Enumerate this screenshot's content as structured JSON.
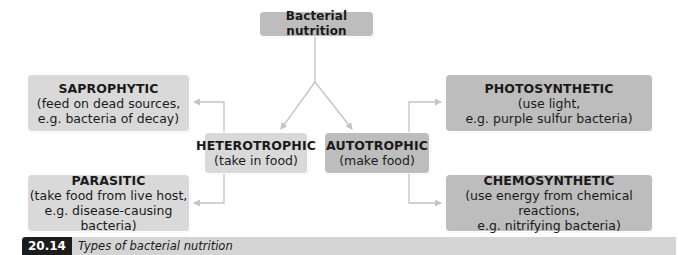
{
  "diagram": {
    "root": {
      "title": "Bacterial nutrition"
    },
    "branches": {
      "heterotrophic": {
        "title": "HETEROTROPHIC",
        "desc": "(take in food)",
        "children": {
          "saprophytic": {
            "title": "SAPROPHYTIC",
            "desc_line1": "(feed on dead sources,",
            "desc_line2": "e.g. bacteria of decay)"
          },
          "parasitic": {
            "title": "PARASITIC",
            "desc_line1": "(take food from live host,",
            "desc_line2": "e.g. disease-causing bacteria)"
          }
        }
      },
      "autotrophic": {
        "title": "AUTOTROPHIC",
        "desc": "(make food)",
        "children": {
          "photosynthetic": {
            "title": "PHOTOSYNTHETIC",
            "desc_line1": "(use light,",
            "desc_line2": "e.g. purple sulfur bacteria)"
          },
          "chemosynthetic": {
            "title": "CHEMOSYNTHETIC",
            "desc_line1": "(use energy from chemical reactions,",
            "desc_line2": "e.g. nitrifying bacteria)"
          }
        }
      }
    },
    "colors": {
      "dark_box": "#bdbdbd",
      "light_box": "#d9d9d9",
      "connector": "#c8c8c8",
      "caption_bar": "#d4d4d4",
      "caption_label_bg": "#1c1c1c"
    }
  },
  "caption": {
    "figure_number": "20.14",
    "text": "Types of bacterial nutrition"
  }
}
